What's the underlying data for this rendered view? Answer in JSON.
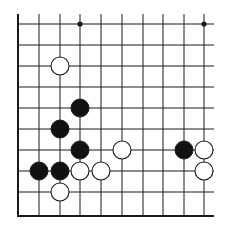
{
  "diagram": {
    "type": "go-board-fragment",
    "board_color": "#ffffff",
    "line_color": "#1a1a1a",
    "columns_x": [
      18,
      39,
      60,
      80,
      101,
      122,
      143,
      163,
      184,
      204
    ],
    "rows_y": [
      24,
      45,
      66,
      87,
      108,
      129,
      150,
      171,
      192
    ],
    "bottom_edge_y": 216,
    "left_edge_x": 18,
    "top_line_start_y": 14,
    "right_line_end_x": 214,
    "stone_radius": 9,
    "star_points": [
      {
        "col": 3,
        "row": 0
      },
      {
        "col": 9,
        "row": 0
      }
    ],
    "stones": [
      {
        "color": "white",
        "col": 2,
        "row": 2
      },
      {
        "color": "black",
        "col": 3,
        "row": 4
      },
      {
        "color": "black",
        "col": 2,
        "row": 5
      },
      {
        "color": "black",
        "col": 3,
        "row": 6
      },
      {
        "color": "white",
        "col": 5,
        "row": 6
      },
      {
        "color": "black",
        "col": 8,
        "row": 6
      },
      {
        "color": "white",
        "col": 9,
        "row": 6
      },
      {
        "color": "black",
        "col": 1,
        "row": 7
      },
      {
        "color": "black",
        "col": 2,
        "row": 7
      },
      {
        "color": "white",
        "col": 3,
        "row": 7
      },
      {
        "color": "white",
        "col": 4,
        "row": 7
      },
      {
        "color": "white",
        "col": 9,
        "row": 7
      },
      {
        "color": "white",
        "col": 2,
        "row": 8
      }
    ]
  }
}
